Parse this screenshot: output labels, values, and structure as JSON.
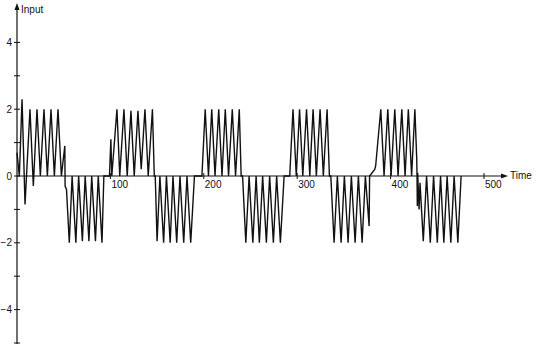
{
  "chart_data": {
    "type": "line",
    "title": "",
    "xlabel": "Time",
    "ylabel": "Input",
    "xlim": [
      0,
      505
    ],
    "ylim": [
      -5,
      5
    ],
    "grid": false,
    "legend": null,
    "x_ticks": [
      100,
      200,
      300,
      400,
      500
    ],
    "x_tick_labels": [
      "100",
      "200",
      "300",
      "400",
      "500"
    ],
    "y_ticks": [
      -5,
      -4,
      -3,
      -2,
      -1,
      0,
      1,
      2,
      3,
      4
    ],
    "y_tick_labels": {
      "4": "4",
      "2": "2",
      "0": "0",
      "-2": "−2",
      "-4": "−4"
    },
    "series": [
      {
        "name": "Input",
        "points": [
          [
            0,
            0.7
          ],
          [
            2.5,
            0
          ],
          [
            5.4,
            2.3
          ],
          [
            8.6,
            -0.85
          ],
          [
            13.9,
            2.0
          ],
          [
            17.5,
            -0.3
          ],
          [
            21.4,
            2.0
          ],
          [
            25,
            0
          ],
          [
            28.9,
            2.0
          ],
          [
            32.5,
            0
          ],
          [
            36.4,
            2.0
          ],
          [
            40,
            0
          ],
          [
            43.9,
            2.0
          ],
          [
            47.5,
            0
          ],
          [
            51.2,
            0.9
          ],
          [
            51.5,
            -0.3
          ],
          [
            53,
            -0.4
          ],
          [
            56,
            -2.0
          ],
          [
            59,
            0
          ],
          [
            63,
            -2.0
          ],
          [
            66,
            0
          ],
          [
            70,
            -1.95
          ],
          [
            73,
            0
          ],
          [
            77,
            -1.95
          ],
          [
            80,
            0
          ],
          [
            84,
            -1.95
          ],
          [
            87,
            0
          ],
          [
            91,
            -2.0
          ],
          [
            93,
            0
          ],
          [
            99,
            0
          ],
          [
            100.5,
            1.1
          ],
          [
            101.5,
            0
          ],
          [
            107,
            2.0
          ],
          [
            110,
            0
          ],
          [
            114.5,
            2.0
          ],
          [
            118,
            0
          ],
          [
            122,
            1.95
          ],
          [
            125.5,
            0
          ],
          [
            129.5,
            1.95
          ],
          [
            133,
            0.2
          ],
          [
            137,
            2.0
          ],
          [
            140.5,
            0
          ],
          [
            145,
            2.0
          ],
          [
            147,
            0
          ],
          [
            148,
            0
          ],
          [
            150,
            -1.95
          ],
          [
            153,
            0
          ],
          [
            157,
            -2.0
          ],
          [
            160,
            0
          ],
          [
            164,
            -2.0
          ],
          [
            167,
            0
          ],
          [
            171,
            -2.0
          ],
          [
            174.5,
            0
          ],
          [
            178.5,
            -2.0
          ],
          [
            182,
            0
          ],
          [
            186,
            -2.0
          ],
          [
            190,
            0
          ],
          [
            198,
            0
          ],
          [
            201.5,
            2.0
          ],
          [
            205,
            0
          ],
          [
            208.5,
            2.0
          ],
          [
            212,
            0
          ],
          [
            216,
            2.0
          ],
          [
            219.5,
            0
          ],
          [
            223,
            2.0
          ],
          [
            226.5,
            0
          ],
          [
            230.5,
            2.0
          ],
          [
            234,
            0
          ],
          [
            238,
            2.0
          ],
          [
            240,
            0
          ],
          [
            241.5,
            0
          ],
          [
            245,
            -2.0
          ],
          [
            248.5,
            0
          ],
          [
            252.5,
            -2.0
          ],
          [
            256,
            0
          ],
          [
            259.5,
            -2.0
          ],
          [
            263,
            0
          ],
          [
            267,
            -2.0
          ],
          [
            270.5,
            0
          ],
          [
            274.5,
            -2.0
          ],
          [
            278,
            0
          ],
          [
            282,
            -2.0
          ],
          [
            286,
            0
          ],
          [
            292,
            0
          ],
          [
            295.5,
            2.0
          ],
          [
            299,
            0
          ],
          [
            302.5,
            2.0
          ],
          [
            306,
            0
          ],
          [
            310,
            2.0
          ],
          [
            313.5,
            0
          ],
          [
            317,
            2.0
          ],
          [
            320.5,
            0
          ],
          [
            324.5,
            2.0
          ],
          [
            328,
            0
          ],
          [
            332,
            2.0
          ],
          [
            334.5,
            0
          ],
          [
            336,
            0
          ],
          [
            339.5,
            -2.0
          ],
          [
            343,
            0
          ],
          [
            347,
            -2.0
          ],
          [
            350.5,
            0
          ],
          [
            354.5,
            -2.0
          ],
          [
            358,
            0
          ],
          [
            362,
            -2.0
          ],
          [
            365.5,
            0
          ],
          [
            369.5,
            -2.0
          ],
          [
            373,
            0
          ],
          [
            377,
            -1.5
          ],
          [
            377.5,
            0
          ],
          [
            383,
            0.2
          ],
          [
            384,
            0.3
          ],
          [
            389.5,
            2.0
          ],
          [
            393,
            0
          ],
          [
            397,
            2.0
          ],
          [
            400.5,
            0
          ],
          [
            404.5,
            2.0
          ],
          [
            408,
            0
          ],
          [
            412,
            2.0
          ],
          [
            415.5,
            0
          ],
          [
            419,
            2.0
          ],
          [
            422.5,
            0
          ],
          [
            426,
            2.0
          ],
          [
            428,
            0.5
          ],
          [
            428.3,
            0
          ],
          [
            428.6,
            -0.9
          ],
          [
            429,
            0.1
          ],
          [
            430.5,
            -1.0
          ],
          [
            431.5,
            -0.2
          ],
          [
            435,
            -1.95
          ],
          [
            438.5,
            0
          ],
          [
            442.5,
            -2.0
          ],
          [
            446,
            0
          ],
          [
            450,
            -2.0
          ],
          [
            453.5,
            0
          ],
          [
            457,
            -2.0
          ],
          [
            460.5,
            0
          ],
          [
            464.5,
            -2.0
          ],
          [
            468,
            0
          ],
          [
            472,
            -2.0
          ],
          [
            475.5,
            0
          ]
        ]
      }
    ]
  },
  "axes": {
    "x_title": "Time",
    "y_title": "Input"
  }
}
